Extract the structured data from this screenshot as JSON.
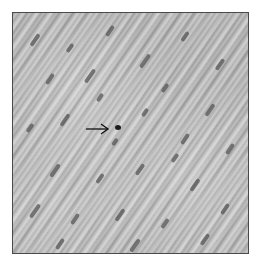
{
  "figure": {
    "type": "grayscale histology micrograph",
    "annotation": {
      "kind": "arrow",
      "direction": "right",
      "target": "dark nucleus"
    },
    "colors": {
      "frame_border": "#4a4a4a",
      "background": "#ffffff",
      "tissue_base": "#b2b2b2",
      "nucleus": "#555555",
      "target_nucleus": "#1c1c1c",
      "arrow": "#111111"
    }
  },
  "nuclei": [
    {
      "x": 20,
      "y": 20,
      "h": 14
    },
    {
      "x": 55,
      "y": 30,
      "h": 10
    },
    {
      "x": 95,
      "y": 12,
      "h": 12
    },
    {
      "x": 130,
      "y": 40,
      "h": 16
    },
    {
      "x": 170,
      "y": 18,
      "h": 11
    },
    {
      "x": 205,
      "y": 45,
      "h": 13
    },
    {
      "x": 35,
      "y": 60,
      "h": 12
    },
    {
      "x": 75,
      "y": 55,
      "h": 16
    },
    {
      "x": 150,
      "y": 70,
      "h": 10
    },
    {
      "x": 195,
      "y": 90,
      "h": 14
    },
    {
      "x": 215,
      "y": 130,
      "h": 12
    },
    {
      "x": 15,
      "y": 110,
      "h": 10
    },
    {
      "x": 50,
      "y": 100,
      "h": 14
    },
    {
      "x": 130,
      "y": 95,
      "h": 9
    },
    {
      "x": 170,
      "y": 120,
      "h": 12
    },
    {
      "x": 40,
      "y": 150,
      "h": 15
    },
    {
      "x": 85,
      "y": 160,
      "h": 11
    },
    {
      "x": 125,
      "y": 150,
      "h": 13
    },
    {
      "x": 180,
      "y": 165,
      "h": 14
    },
    {
      "x": 210,
      "y": 190,
      "h": 12
    },
    {
      "x": 20,
      "y": 190,
      "h": 16
    },
    {
      "x": 60,
      "y": 200,
      "h": 12
    },
    {
      "x": 105,
      "y": 195,
      "h": 14
    },
    {
      "x": 150,
      "y": 205,
      "h": 11
    },
    {
      "x": 190,
      "y": 220,
      "h": 13
    },
    {
      "x": 45,
      "y": 225,
      "h": 12
    },
    {
      "x": 120,
      "y": 225,
      "h": 15
    },
    {
      "x": 85,
      "y": 80,
      "h": 9
    },
    {
      "x": 160,
      "y": 140,
      "h": 10
    },
    {
      "x": 100,
      "y": 125,
      "h": 8
    }
  ]
}
